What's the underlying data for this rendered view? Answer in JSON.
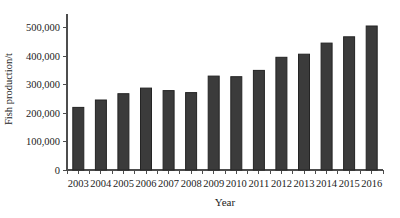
{
  "figure": {
    "background": "#ffffff",
    "bar_color": "#3b3b3b",
    "bar_edge_color": "#242424",
    "axis_color": "#4d4d4d",
    "text_color": "#1c1c1c"
  },
  "chart_data": {
    "type": "bar",
    "title": "",
    "xlabel": "Year",
    "ylabel": "Fish production/t",
    "categories": [
      "2003",
      "2004",
      "2005",
      "2006",
      "2007",
      "2008",
      "2009",
      "2010",
      "2011",
      "2012",
      "2013",
      "2014",
      "2015",
      "2016"
    ],
    "values": [
      220000,
      246000,
      268000,
      288000,
      279000,
      272000,
      330000,
      328000,
      350000,
      396000,
      407000,
      446000,
      468000,
      506000
    ],
    "series": [
      {
        "name": "Fish production",
        "values": [
          220000,
          246000,
          268000,
          288000,
          279000,
          272000,
          330000,
          328000,
          350000,
          396000,
          407000,
          446000,
          468000,
          506000
        ]
      }
    ],
    "ylim": [
      0,
      550000
    ],
    "yticks": [
      0,
      100000,
      200000,
      300000,
      400000,
      500000
    ],
    "ytick_labels": [
      "0",
      "100,000",
      "200,000",
      "300,000",
      "400,000",
      "500,000"
    ],
    "grid": false,
    "legend_position": "none"
  }
}
